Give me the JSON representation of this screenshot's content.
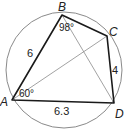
{
  "diagram": {
    "type": "cyclic-quadrilateral",
    "circle": {
      "cx": 64,
      "cy": 70,
      "r": 58,
      "stroke": "#888888"
    },
    "points": {
      "A": {
        "label": "A",
        "x": 12,
        "y": 100
      },
      "B": {
        "label": "B",
        "x": 62,
        "y": 15
      },
      "C": {
        "label": "C",
        "x": 107,
        "y": 36
      },
      "D": {
        "label": "D",
        "x": 114,
        "y": 103
      }
    },
    "sides": {
      "AB": "6",
      "CD": "4",
      "AD": "6.3"
    },
    "angles": {
      "B": "98°",
      "A": "60°"
    },
    "diagonals": [
      "AC",
      "BD"
    ],
    "colors": {
      "quad": "#1a1a1a",
      "diagonal": "#888888",
      "circle": "#888888"
    }
  }
}
